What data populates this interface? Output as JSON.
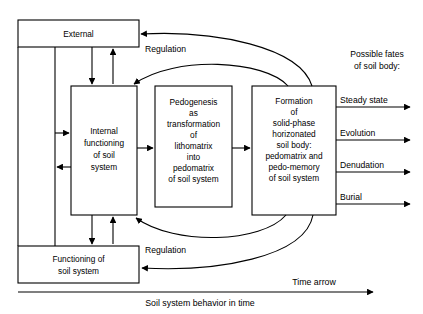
{
  "figure": {
    "type": "block-flow-diagram",
    "background_color": "#ffffff",
    "line_color": "#000000"
  },
  "boxes": {
    "external": {
      "lines": [
        "External"
      ]
    },
    "internal_functioning": {
      "lines": [
        "Internal",
        "functioning",
        "of soil",
        "system"
      ]
    },
    "pedogenesis": {
      "lines": [
        "Pedogenesis",
        "as",
        "transformation",
        "of",
        "lithomatrix",
        "into",
        "pedomatrix",
        "of soil system"
      ]
    },
    "formation": {
      "lines": [
        "Formation",
        "of",
        "solid-phase",
        "horizonated",
        "soil body:",
        "pedomatrix and",
        "pedo-memory",
        "of soil system"
      ]
    },
    "functioning": {
      "lines": [
        "Functioning of",
        "soil system"
      ]
    }
  },
  "edge_labels": {
    "regulation_top": "Regulation",
    "regulation_bottom": "Regulation"
  },
  "fates": {
    "heading_lines": [
      "Possible fates",
      "of soil body:"
    ],
    "items": [
      {
        "label": "Steady state"
      },
      {
        "label": "Evolution"
      },
      {
        "label": "Denudation"
      },
      {
        "label": "Burial"
      }
    ]
  },
  "axis": {
    "time_arrow_label": "Time arrow",
    "caption": "Soil system behavior in time"
  }
}
